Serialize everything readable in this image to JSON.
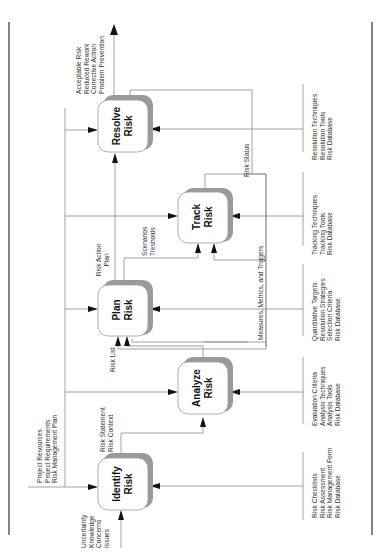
{
  "diagram": {
    "orientation": "rotated 90 degrees counter-clockwise",
    "colors": {
      "line": "#8a8a8a",
      "box_shadow": "#9a9a9a",
      "arrow": "#111111",
      "border": "#333333",
      "text": "#333333"
    },
    "processes": {
      "identify": {
        "line1": "Identify",
        "line2": "Risk"
      },
      "analyze": {
        "line1": "Analyze",
        "line2": "Risk"
      },
      "plan": {
        "line1": "Plan",
        "line2": "Risk"
      },
      "track": {
        "line1": "Track",
        "line2": "Risk"
      },
      "resolve": {
        "line1": "Resolve",
        "line2": "Risk"
      }
    },
    "inputs": {
      "identify_in": [
        "Uncertainty",
        "Knowledge",
        "Concerns",
        "Issues"
      ]
    },
    "controls": {
      "project": [
        "Project Resources",
        "Project Requirements",
        "Risk Management Plan"
      ]
    },
    "flows": {
      "identify_to_analyze": [
        "Risk Statement",
        "Risk Context"
      ],
      "analyze_to_plan": [
        "Risk List"
      ],
      "plan_to_resolve": [
        "Risk Action",
        "Plan"
      ],
      "plan_to_track": [
        "Scenarios",
        "Tresholds"
      ],
      "track_feedback": [
        "Measures, Metrics, and Triggers"
      ],
      "track_to_resolve": [
        "Risk Status"
      ]
    },
    "outputs": {
      "resolve_out": [
        "Acceptable Risk",
        "Reduced Rework",
        "Corrective Action",
        "Problem Prevention"
      ]
    },
    "mechanisms": {
      "identify": [
        "Risk Checklists",
        "Risk Assessment",
        "Risk Management Form",
        "Risk Database"
      ],
      "analyze": [
        "Evaluation Criteria",
        "Analysis Techniques",
        "Analysis Tools",
        "Risk Database"
      ],
      "plan": [
        "Quantitative Targets",
        "Resolution Strategies",
        "Selection Criteria",
        "Risk Database"
      ],
      "track": [
        "Tracking Techniques",
        "Tracking Tools",
        "Risk Database"
      ],
      "resolve": [
        "Resolution Techniques",
        "Resolution Tools",
        "Risk Database"
      ]
    }
  }
}
